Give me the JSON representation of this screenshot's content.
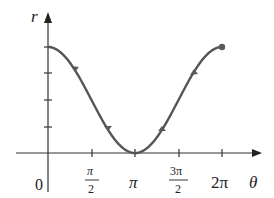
{
  "chart_data": {
    "type": "line",
    "title": "",
    "xlabel": "θ",
    "ylabel": "r",
    "function": "r = 1 + cos θ",
    "x_ticks": [
      "0",
      "π/2",
      "π",
      "3π/2",
      "2π"
    ],
    "x_tick_values": [
      0,
      1.5708,
      3.1416,
      4.7124,
      6.2832
    ],
    "y_ticks_count": 4,
    "y_tick_values": [
      0.5,
      1.0,
      1.5,
      2.0
    ],
    "xlim": [
      0,
      6.2832
    ],
    "ylim": [
      0,
      2
    ],
    "series": [
      {
        "name": "r = 1 + cos θ",
        "x": [
          0,
          0.785,
          1.571,
          2.356,
          3.142,
          3.927,
          4.712,
          5.498,
          6.283
        ],
        "values": [
          2.0,
          1.707,
          1.0,
          0.293,
          0.0,
          0.293,
          1.0,
          1.707,
          2.0
        ]
      }
    ],
    "color": "#555555",
    "endpoint_marker": true,
    "grid": false
  },
  "labels": {
    "origin": "0",
    "x_axis": "θ",
    "y_axis": "r",
    "pi_half_num": "π",
    "pi_half_den": "2",
    "pi": "π",
    "three_pi_half_num": "3π",
    "three_pi_half_den": "2",
    "two_pi": "2π"
  }
}
